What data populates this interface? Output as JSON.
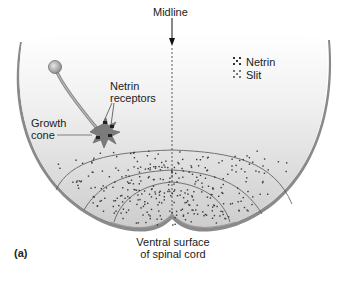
{
  "figure": {
    "panel_label": "(a)",
    "midline_label": "Midline",
    "netrin_receptors_label": [
      "Netrin",
      "receptors"
    ],
    "growth_cone_label": [
      "Growth",
      "cone"
    ],
    "ventral_label": [
      "Ventral surface",
      "of spinal cord"
    ]
  },
  "legend": {
    "items": [
      {
        "label": "Netrin",
        "icon": "netrin-dot-icon",
        "color": "#333333"
      },
      {
        "label": "Slit",
        "icon": "slit-dot-icon",
        "color": "#777777"
      }
    ]
  },
  "colors": {
    "outline": "#7a7a7a",
    "fill_top": "#ffffff",
    "fill_bottom": "#cfcfcf",
    "neuron": "#a9a9a9",
    "dot": "#3a3a3a"
  }
}
